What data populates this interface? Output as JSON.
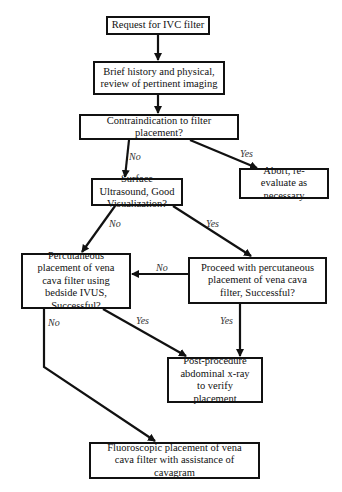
{
  "diagram": {
    "type": "flowchart",
    "nodes": [
      {
        "id": "request",
        "text": "Request for IVC filter"
      },
      {
        "id": "history",
        "text": "Brief history and physical, review of pertinent imaging"
      },
      {
        "id": "contraindication",
        "text": "Contraindication to filter placement?"
      },
      {
        "id": "abort",
        "text": "Abort, re-evaluate as necessary"
      },
      {
        "id": "ultrasound",
        "text": "Surface Ultrasound, Good Visualization?"
      },
      {
        "id": "ivus",
        "text": "Percutaneous placement of vena cava filter using bedside IVUS, Successful?"
      },
      {
        "id": "proceed",
        "text": "Proceed with percutaneous placement of vena cava filter, Successful?"
      },
      {
        "id": "xray",
        "text": "Post-procedure abdominal x-ray to verify placement"
      },
      {
        "id": "fluoro",
        "text": "Fluoroscopic placement of vena cava filter with assistance of cavagram"
      }
    ],
    "edges": [
      {
        "from": "request",
        "to": "history",
        "label": ""
      },
      {
        "from": "history",
        "to": "contraindication",
        "label": ""
      },
      {
        "from": "contraindication",
        "to": "ultrasound",
        "label": "No"
      },
      {
        "from": "contraindication",
        "to": "abort",
        "label": "Yes"
      },
      {
        "from": "ultrasound",
        "to": "ivus",
        "label": "No"
      },
      {
        "from": "ultrasound",
        "to": "proceed",
        "label": "Yes"
      },
      {
        "from": "proceed",
        "to": "ivus",
        "label": "No"
      },
      {
        "from": "proceed",
        "to": "xray",
        "label": "Yes"
      },
      {
        "from": "ivus",
        "to": "xray",
        "label": "Yes"
      },
      {
        "from": "ivus",
        "to": "fluoro",
        "label": "No"
      }
    ]
  },
  "nodes": {
    "request": "Request for IVC filter",
    "history": "Brief history and physical, review of pertinent imaging",
    "contraindication": "Contraindication to filter placement?",
    "abort": "Abort, re-evaluate as necessary",
    "ultrasound": "Surface Ultrasound, Good Visualization?",
    "ivus": "Percutaneous placement of vena cava filter using bedside IVUS, Successful?",
    "proceed": "Proceed with percutaneous placement of vena cava filter, Successful?",
    "xray": "Post-procedure abdominal x-ray to verify placement",
    "fluoro": "Fluoroscopic placement of vena cava filter with assistance of cavagram"
  },
  "labels": {
    "contra_no": "No",
    "contra_yes": "Yes",
    "us_no": "No",
    "us_yes": "Yes",
    "proceed_no": "No",
    "proceed_yes": "Yes",
    "ivus_yes": "Yes",
    "ivus_no": "No"
  },
  "colors": {
    "stroke": "#111111",
    "background": "#ffffff",
    "label": "#333333"
  }
}
